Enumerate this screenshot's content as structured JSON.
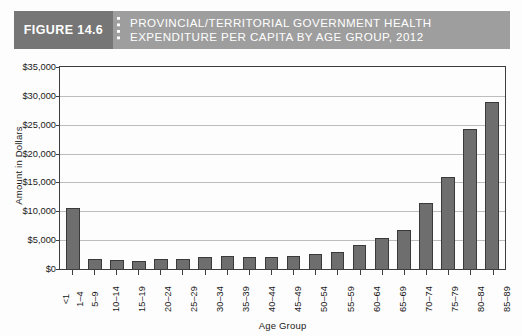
{
  "header": {
    "figure_label": "FIGURE 14.6",
    "title_line1": "PROVINCIAL/TERRITORIAL GOVERNMENT HEALTH",
    "title_line2": "EXPENDITURE PER CAPITA BY AGE GROUP, 2012",
    "tag_bg": "#767676",
    "banner_bg": "#9e9e9e",
    "text_color": "#ffffff"
  },
  "chart_data": {
    "type": "bar",
    "title": "PROVINCIAL/TERRITORIAL GOVERNMENT HEALTH EXPENDITURE PER CAPITA BY AGE GROUP, 2012",
    "xlabel": "Age Group",
    "ylabel": "Amount in Dollars",
    "categories": [
      "<1",
      "1–4",
      "5–9",
      "10–14",
      "15–19",
      "20–24",
      "25–29",
      "30–34",
      "35–39",
      "40–44",
      "45–49",
      "50–54",
      "55–59",
      "60–64",
      "65–69",
      "70–74",
      "75–79",
      "80–84",
      "85–89",
      "90+"
    ],
    "values": [
      10600,
      1700,
      1500,
      1450,
      1700,
      1650,
      2000,
      2250,
      2050,
      2050,
      2300,
      2650,
      3000,
      4200,
      5300,
      6800,
      11500,
      16000,
      24300,
      28900
    ],
    "ylim": [
      0,
      35000
    ],
    "yticks": [
      0,
      5000,
      10000,
      15000,
      20000,
      25000,
      30000,
      35000
    ],
    "ytick_labels": [
      "$0",
      "$5,000",
      "$10,000",
      "$15,000",
      "$20,000",
      "$25,000",
      "$30,000",
      "$35,000"
    ],
    "grid": true,
    "legend": "none",
    "bar_color": "#6e6e6e",
    "bar_border_color": "#3a3a3a",
    "gridline_color": "#bdbdbd",
    "axis_color": "#3d3d3d"
  }
}
